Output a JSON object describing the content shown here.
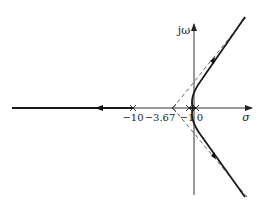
{
  "diagram": {
    "type": "root-locus",
    "axes": {
      "real_axis_label": "σ",
      "imag_axis_label": "jω"
    },
    "tick_labels": [
      {
        "id": "pole-neg10",
        "text": "−10",
        "value": -10
      },
      {
        "id": "centroid",
        "text": "−3.67",
        "value": -3.67
      },
      {
        "id": "pole-neg1",
        "text": "−1",
        "value": -1
      },
      {
        "id": "origin",
        "text": "0",
        "value": 0
      }
    ],
    "poles": [
      -10,
      -1,
      0
    ],
    "asymptote_centroid": -3.67,
    "colors": {
      "locus": "#1a1a1a",
      "axis": "#333333",
      "asymptote": "#555555"
    }
  }
}
